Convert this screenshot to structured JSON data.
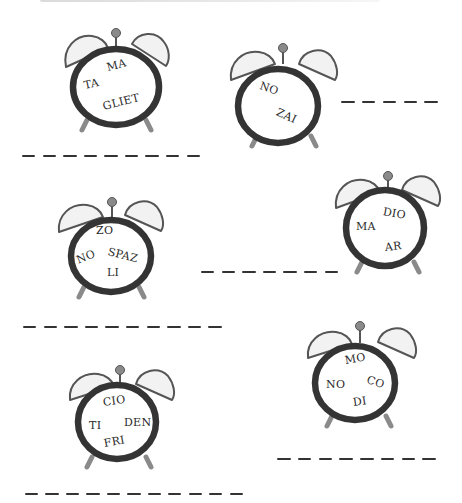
{
  "worksheet": {
    "header_text_cropped": "",
    "colors": {
      "ring": "#343434",
      "bell_fill": "#f2f2f2",
      "bell_stroke": "#555555",
      "knob": "#8a8a8a",
      "leg": "#8a8a8a",
      "text": "#2a2a2a",
      "dash": "#333333"
    },
    "clocks": [
      {
        "id": "clock-1",
        "syllables": [
          "MA",
          "TA",
          "GLIET"
        ]
      },
      {
        "id": "clock-2",
        "syllables": [
          "NO",
          "ZAI"
        ]
      },
      {
        "id": "clock-3",
        "syllables": [
          "ZO",
          "NO",
          "SPAZ",
          "LI"
        ]
      },
      {
        "id": "clock-4",
        "syllables": [
          "DIO",
          "MA",
          "AR"
        ]
      },
      {
        "id": "clock-5",
        "syllables": [
          "MO",
          "NO",
          "CO",
          "DI"
        ]
      },
      {
        "id": "clock-6",
        "syllables": [
          "CIO",
          "TI",
          "DEN",
          "FRI"
        ]
      }
    ],
    "answer_blanks": [
      {
        "id": "blank-1",
        "dash_count": 9
      },
      {
        "id": "blank-2",
        "dash_count": 5
      },
      {
        "id": "blank-3",
        "dash_count": 7
      },
      {
        "id": "blank-4",
        "dash_count": 10
      },
      {
        "id": "blank-5",
        "dash_count": 8
      },
      {
        "id": "blank-6",
        "dash_count": 11
      }
    ]
  }
}
